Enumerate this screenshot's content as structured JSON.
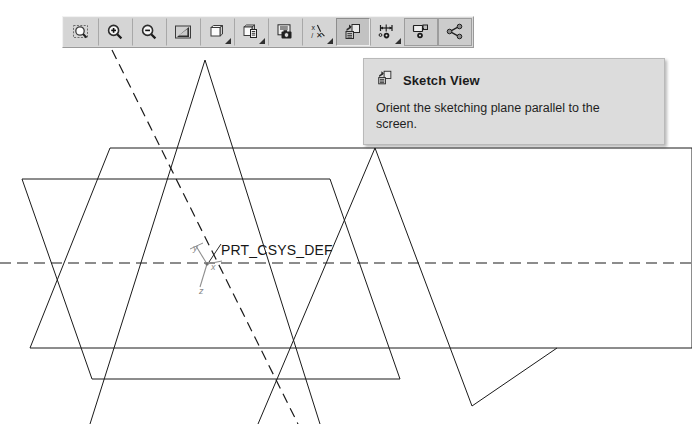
{
  "window": {
    "background_color": "#ffffff",
    "app_kind": "cad-3d-modeler"
  },
  "toolbar": {
    "name": "View toolbar",
    "background_color": "#d8d8d8",
    "buttons": [
      {
        "id": "refit",
        "icon": "zoom-fit-icon",
        "label": "Refit",
        "has_dropdown": false,
        "state": "normal"
      },
      {
        "id": "zoom-in",
        "icon": "zoom-in-icon",
        "label": "Zoom In",
        "has_dropdown": false,
        "state": "normal"
      },
      {
        "id": "zoom-out",
        "icon": "zoom-out-icon",
        "label": "Zoom Out",
        "has_dropdown": false,
        "state": "normal"
      },
      {
        "id": "repaint",
        "icon": "repaint-shading-icon",
        "label": "Repaint",
        "has_dropdown": false,
        "state": "normal"
      },
      {
        "id": "display-style",
        "icon": "display-style-icon",
        "label": "Display Style",
        "has_dropdown": true,
        "state": "normal"
      },
      {
        "id": "saved-views",
        "icon": "saved-views-icon",
        "label": "Saved View List",
        "has_dropdown": true,
        "state": "normal"
      },
      {
        "id": "view-manager",
        "icon": "view-manager-icon",
        "label": "View Manager",
        "has_dropdown": false,
        "state": "normal"
      },
      {
        "id": "datum-display",
        "icon": "datum-display-icon",
        "label": "Datum Display Filters",
        "has_dropdown": true,
        "state": "normal"
      },
      {
        "id": "sketch-view",
        "icon": "sketch-view-icon",
        "label": "Sketch View",
        "has_dropdown": false,
        "state": "pressed"
      },
      {
        "id": "annot-display",
        "icon": "annotation-display-icon",
        "label": "Annotation Display",
        "has_dropdown": true,
        "state": "normal"
      },
      {
        "id": "layer-display",
        "icon": "layer-display-icon",
        "label": "Layer Display",
        "has_dropdown": false,
        "state": "hover"
      },
      {
        "id": "explode-view",
        "icon": "explode-view-icon",
        "label": "Explode View",
        "has_dropdown": false,
        "state": "hover"
      }
    ]
  },
  "tooltip": {
    "visible": true,
    "icon": "sketch-view-icon",
    "title": "Sketch View",
    "description": "Orient the sketching plane parallel to the screen.",
    "background_color": "#dcdcdc",
    "border_color": "#b9b9b9"
  },
  "graphics_area": {
    "csys_label": "PRT_CSYS_DEF",
    "axis_labels": {
      "x": "x",
      "y": "y",
      "z": "z"
    },
    "line_color": "#1a1a1a",
    "datum_color": "#9a9a9a",
    "planes": [
      {
        "name": "datum-plane-front",
        "style": "solid"
      },
      {
        "name": "datum-plane-top",
        "style": "solid"
      },
      {
        "name": "datum-plane-right",
        "style": "solid"
      }
    ],
    "axis_lines": [
      {
        "name": "horizontal-centerline",
        "style": "dashed"
      },
      {
        "name": "diagonal-centerline",
        "style": "dashed"
      }
    ]
  },
  "caption": {
    "text": ""
  }
}
